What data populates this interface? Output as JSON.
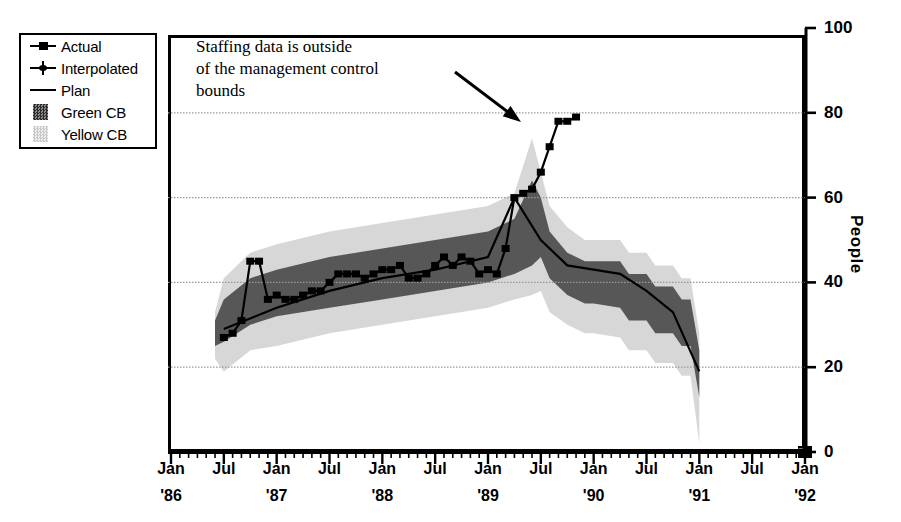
{
  "chart_data": {
    "type": "line",
    "title": "",
    "xlabel": "",
    "ylabel": "People",
    "ylim": [
      0,
      100
    ],
    "yticks": [
      0,
      20,
      40,
      60,
      80,
      100
    ],
    "ytick_labels": [
      "0",
      "20",
      "40",
      "60",
      "80",
      "100"
    ],
    "grid": "horizontal-dotted",
    "xlim": [
      "Jan '86",
      "Jan '92"
    ],
    "xtick_labels": [
      {
        "month": "Jan",
        "year": "'86"
      },
      {
        "month": "Jul",
        "year": ""
      },
      {
        "month": "Jan",
        "year": "'87"
      },
      {
        "month": "Jul",
        "year": ""
      },
      {
        "month": "Jan",
        "year": "'88"
      },
      {
        "month": "Jul",
        "year": ""
      },
      {
        "month": "Jan",
        "year": "'89"
      },
      {
        "month": "Jul",
        "year": ""
      },
      {
        "month": "Jan",
        "year": "'90"
      },
      {
        "month": "Jul",
        "year": ""
      },
      {
        "month": "Jan",
        "year": "'91"
      },
      {
        "month": "Jul",
        "year": ""
      },
      {
        "month": "Jan",
        "year": "'92"
      }
    ],
    "legend": {
      "position": "top-left-outside",
      "entries": [
        {
          "label": "Actual",
          "marker": "square",
          "style": "line-with-markers",
          "color": "#000000"
        },
        {
          "label": "Interpolated",
          "marker": "plus",
          "style": "markers",
          "color": "#000000"
        },
        {
          "label": "Plan",
          "marker": "none",
          "style": "line",
          "color": "#000000"
        },
        {
          "label": "Green CB",
          "marker": "swatch",
          "style": "band",
          "color": "#555555"
        },
        {
          "label": "Yellow CB",
          "marker": "swatch",
          "style": "band",
          "color": "#d5d5d5"
        }
      ]
    },
    "annotation": {
      "text": "Staffing data is outside of the management control bounds",
      "lines": [
        "Staffing data is outside",
        "of the management control",
        "bounds"
      ],
      "arrow_from": [
        455,
        72
      ],
      "arrow_to": [
        521,
        122
      ]
    },
    "series": [
      {
        "name": "Actual",
        "x": [
          "Jul '86",
          "Aug '86",
          "Sep '86",
          "Oct '86",
          "Nov '86",
          "Dec '86",
          "Jan '87",
          "Feb '87",
          "Mar '87",
          "Apr '87",
          "May '87",
          "Jun '87",
          "Jul '87",
          "Aug '87",
          "Sep '87",
          "Oct '87",
          "Nov '87",
          "Dec '87",
          "Jan '88",
          "Feb '88",
          "Mar '88",
          "Apr '88",
          "May '88",
          "Jun '88",
          "Jul '88",
          "Aug '88",
          "Sep '88",
          "Oct '88",
          "Nov '88",
          "Dec '88",
          "Jan '89",
          "Feb '89",
          "Mar '89",
          "Apr '89",
          "May '89",
          "Jun '89",
          "Jul '89",
          "Aug '89",
          "Sep '89",
          "Oct '89",
          "Nov '89"
        ],
        "values": [
          27,
          28,
          31,
          45,
          45,
          36,
          37,
          36,
          36,
          37,
          38,
          38,
          40,
          42,
          42,
          42,
          41,
          42,
          43,
          43,
          44,
          41,
          41,
          42,
          44,
          46,
          44,
          46,
          45,
          42,
          43,
          42,
          48,
          60,
          61,
          62,
          66,
          72,
          78,
          78,
          79
        ],
        "color": "#000000"
      },
      {
        "name": "Plan",
        "x": [
          "Jul '86",
          "Jan '87",
          "Jul '87",
          "Jan '88",
          "Jul '88",
          "Jan '89",
          "Apr '89",
          "Jul '89",
          "Oct '89",
          "Jan '90",
          "Apr '90",
          "Jul '90",
          "Oct '90",
          "Jan '91"
        ],
        "values": [
          29,
          34,
          38,
          41,
          43,
          46,
          60,
          50,
          44,
          43,
          42,
          38,
          33,
          19
        ],
        "color": "#000000"
      },
      {
        "name": "Green CB",
        "type": "band",
        "color": "#555555",
        "description": "Inner dark-gray management control band around the plan"
      },
      {
        "name": "Yellow CB",
        "type": "band",
        "color": "#d5d5d5",
        "description": "Outer light-gray management control band around the plan"
      }
    ],
    "marker_isolated": {
      "x": "Jan '92",
      "value": 0,
      "marker": "square"
    }
  },
  "axis": {
    "y_title": "People"
  }
}
